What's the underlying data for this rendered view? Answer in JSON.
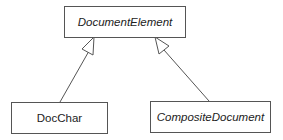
{
  "diagram": {
    "type": "uml-class-inheritance",
    "classes": [
      {
        "id": "document-element",
        "name": "DocumentElement",
        "abstract": true
      },
      {
        "id": "doc-char",
        "name": "DocChar",
        "abstract": false
      },
      {
        "id": "composite-document",
        "name": "CompositeDocument",
        "abstract": true
      }
    ],
    "relations": [
      {
        "from": "DocChar",
        "to": "DocumentElement",
        "kind": "generalization"
      },
      {
        "from": "CompositeDocument",
        "to": "DocumentElement",
        "kind": "generalization"
      }
    ],
    "colors": {
      "line": "#555555",
      "text": "#222222",
      "background": "#ffffff"
    }
  }
}
